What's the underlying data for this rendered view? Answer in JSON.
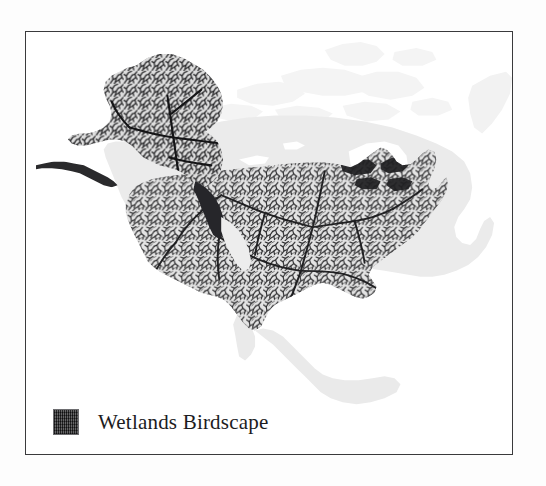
{
  "figure": {
    "kind": "thematic-map",
    "region": "North America",
    "frame_visible": true,
    "background_color": "#ffffff"
  },
  "legend": {
    "label": "Wetlands Birdscape",
    "swatch_name": "wetlands-birdscape-swatch",
    "swatch_color": "#3b3b3d",
    "swatch_pattern": "dense-crosshatch"
  },
  "colors": {
    "land_base": "#e9e9e9",
    "land_base_light": "#f1f1f1",
    "arctic_land": "#f4f4f4",
    "water": "#ffffff",
    "network_dark": "#2a2a2c",
    "frame_stroke": "#3a3a3c",
    "page_background": "#fdfdfd"
  },
  "map_layers": [
    {
      "name": "north-america-landmass",
      "description": "Light gray base landmass for North America including Canada, United States, Mexico and Arctic islands",
      "fill": "#e9e9e9"
    },
    {
      "name": "hudson-bay-water",
      "description": "White water body within Canada",
      "fill": "#ffffff"
    },
    {
      "name": "great-lakes-water",
      "description": "White lake bodies between United States and Canada",
      "fill": "#ffffff"
    },
    {
      "name": "wetlands-birdscape-network",
      "description": "Dense dark dendritic wetland / river network covering the conterminous United States and Alaska",
      "stroke": "#2a2a2c"
    }
  ],
  "coverage_regions": [
    {
      "name": "conterminous-united-states",
      "shaded": true
    },
    {
      "name": "alaska",
      "shaded": true
    },
    {
      "name": "canada",
      "shaded": false
    },
    {
      "name": "mexico",
      "shaded": false
    }
  ]
}
